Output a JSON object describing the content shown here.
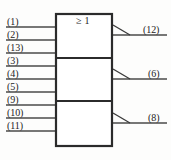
{
  "diagram": {
    "type": "logic-gate-schematic",
    "notation": "IEC",
    "gate_symbol": "≥ 1",
    "colors": {
      "background": "#fdfdfc",
      "outline": "#2b2b2b",
      "wire": "#4a4a4a",
      "text": "#232323"
    },
    "body": {
      "x": 56,
      "y": 14,
      "width": 56,
      "height": 132,
      "dividers_y": [
        58,
        101
      ]
    },
    "sections": [
      {
        "name": "gate-1",
        "symbol": "≥ 1",
        "inputs": [
          "(1)",
          "(2)",
          "(13)"
        ],
        "output": "(12)"
      },
      {
        "name": "gate-2",
        "symbol": "",
        "inputs": [
          "(3)",
          "(4)",
          "(5)"
        ],
        "output": "(6)"
      },
      {
        "name": "gate-3",
        "symbol": "",
        "inputs": [
          "(9)",
          "(10)",
          "(11)"
        ],
        "output": "(8)"
      }
    ],
    "inputs": [
      {
        "label": "(1)",
        "wire_y": 27,
        "label_x": 7,
        "label_y": 17
      },
      {
        "label": "(2)",
        "wire_y": 40,
        "label_x": 7,
        "label_y": 30
      },
      {
        "label": "(13)",
        "wire_y": 53,
        "label_x": 7,
        "label_y": 43
      },
      {
        "label": "(3)",
        "wire_y": 66,
        "label_x": 7,
        "label_y": 56
      },
      {
        "label": "(4)",
        "wire_y": 79,
        "label_x": 7,
        "label_y": 69
      },
      {
        "label": "(5)",
        "wire_y": 92,
        "label_x": 7,
        "label_y": 82
      },
      {
        "label": "(9)",
        "wire_y": 105,
        "label_x": 7,
        "label_y": 95
      },
      {
        "label": "(10)",
        "wire_y": 118,
        "label_x": 7,
        "label_y": 108
      },
      {
        "label": "(11)",
        "wire_y": 131,
        "label_x": 7,
        "label_y": 121
      }
    ],
    "outputs": [
      {
        "label": "(12)",
        "wire_y": 35,
        "label_x": 143,
        "label_y": 25
      },
      {
        "label": "(6)",
        "wire_y": 79,
        "label_x": 148,
        "label_y": 69
      },
      {
        "label": "(8)",
        "wire_y": 123,
        "label_x": 148,
        "label_y": 113
      }
    ],
    "wire_start_x": 6,
    "wire_end_x": 167,
    "wedge": {
      "name": "amplifier-wedge",
      "depth": 17,
      "rise": 10
    }
  }
}
